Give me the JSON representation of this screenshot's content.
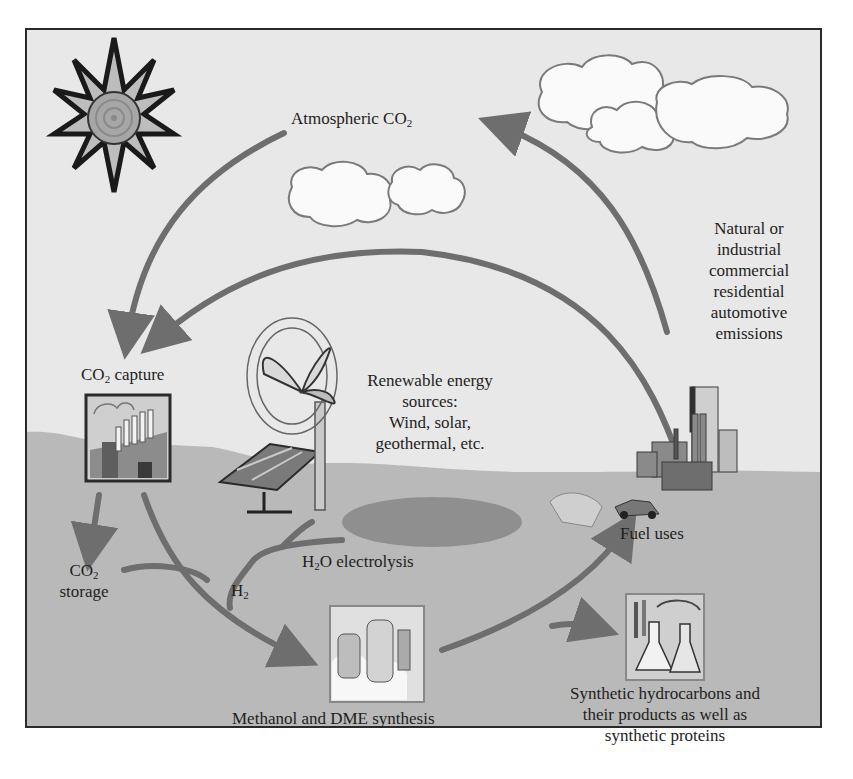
{
  "diagram": {
    "type": "cycle",
    "title": "",
    "colors": {
      "sky": "#e8e8e8",
      "ground": "#b9b9b9",
      "arrow": "#6e6e6e",
      "frame": "#2a2a2a",
      "text": "#1e1e1e"
    },
    "nodes": {
      "atmospheric_co2": {
        "text": "Atmospheric CO",
        "sub": "2"
      },
      "emissions": {
        "lines": [
          "Natural or",
          "industrial",
          "commercial",
          "residential",
          "automotive",
          "emissions"
        ]
      },
      "co2_capture": {
        "pre": "CO",
        "sub": "2",
        "post": " capture"
      },
      "renewable": {
        "lines": [
          "Renewable energy",
          "sources:",
          "Wind, solar,",
          "geothermal, etc."
        ]
      },
      "co2_storage": {
        "pre": "CO",
        "sub": "2",
        "line2": "storage"
      },
      "h2o_electrolysis": {
        "pre": "H",
        "sub": "2",
        "post": "O electrolysis"
      },
      "h2": {
        "pre": "H",
        "sub": "2"
      },
      "fuel_uses": {
        "text": "Fuel uses"
      },
      "methanol": {
        "text": "Methanol and DME synthesis"
      },
      "synthetic": {
        "lines": [
          "Synthetic hydrocarbons and",
          "their products as well as",
          "synthetic proteins"
        ]
      }
    },
    "icons": [
      "sun-icon",
      "cloud-icon",
      "wind-turbine-icon",
      "solar-panel-icon",
      "factory-icon",
      "city-skyline-icon",
      "car-icon",
      "chemical-plant-icon",
      "lab-flask-icon"
    ],
    "edges": [
      {
        "from": "Atmospheric CO2",
        "to": "CO2 capture"
      },
      {
        "from": "Emissions",
        "to": "CO2 capture"
      },
      {
        "from": "Emissions",
        "to": "Atmospheric CO2"
      },
      {
        "from": "CO2 capture",
        "to": "CO2 storage"
      },
      {
        "from": "CO2 storage",
        "to": "Methanol and DME synthesis"
      },
      {
        "from": "CO2 capture",
        "to": "Methanol and DME synthesis"
      },
      {
        "from": "Renewable energy sources",
        "to": "H2O electrolysis"
      },
      {
        "from": "H2O electrolysis",
        "to": "Methanol and DME synthesis",
        "label": "H2"
      },
      {
        "from": "Methanol and DME synthesis",
        "to": "Fuel uses"
      },
      {
        "from": "Methanol and DME synthesis",
        "to": "Synthetic hydrocarbons"
      }
    ]
  }
}
